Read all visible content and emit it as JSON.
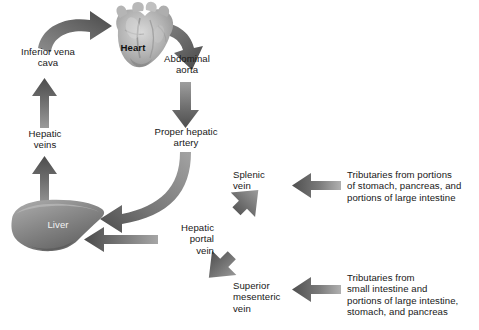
{
  "diagram": {
    "type": "flow-diagram",
    "background": "#ffffff",
    "text_color": "#181818",
    "arrow_dark": "#4a4a4a",
    "arrow_light": "#a8a8a8",
    "organ_gray": "#8d8d8d"
  },
  "labels": {
    "inferior_vena_cava": "Inferior vena\ncava",
    "heart": "Heart",
    "abdominal_aorta": "Abdominal\naorta",
    "hepatic_veins": "Hepatic\nveins",
    "proper_hepatic_artery": "Proper hepatic\nartery",
    "liver": "Liver",
    "splenic_vein": "Splenic\nvein",
    "hepatic_portal_vein": "Hepatic\nportal\nvein",
    "superior_mesenteric_vein": "Superior\nmesenteric\nvein",
    "tributaries_upper": "Tributaries from portions\nof stomach, pancreas, and\nportions of large intestine",
    "tributaries_lower": "Tributaries from\nsmall intestine and\nportions of large intestine,\nstomach, and pancreas"
  },
  "flow": {
    "nodes": [
      "Inferior vena cava",
      "Heart",
      "Abdominal aorta",
      "Hepatic veins",
      "Proper hepatic artery",
      "Liver",
      "Splenic vein",
      "Hepatic portal vein",
      "Superior mesenteric vein"
    ],
    "edges": [
      {
        "from": "Inferior vena cava",
        "to": "Heart",
        "style": "curved-arrow"
      },
      {
        "from": "Heart",
        "to": "Abdominal aorta",
        "style": "curved-arrow"
      },
      {
        "from": "Abdominal aorta",
        "to": "Proper hepatic artery",
        "style": "straight-arrow-down"
      },
      {
        "from": "Proper hepatic artery",
        "to": "Liver",
        "style": "curved-arrow"
      },
      {
        "from": "Liver",
        "to": "Hepatic veins",
        "style": "straight-arrow-up"
      },
      {
        "from": "Hepatic veins",
        "to": "Inferior vena cava",
        "style": "straight-arrow-up"
      },
      {
        "from": "Hepatic portal vein",
        "to": "Liver",
        "style": "straight-arrow-left"
      },
      {
        "from": "Splenic vein",
        "to": "Hepatic portal vein",
        "style": "diagonal-arrow-down-left"
      },
      {
        "from": "Superior mesenteric vein",
        "to": "Hepatic portal vein",
        "style": "diagonal-arrow-up-left"
      },
      {
        "from": "Tributaries (stomach, pancreas, large intestine)",
        "to": "Splenic vein",
        "style": "straight-arrow-left"
      },
      {
        "from": "Tributaries (small intestine, large intestine, stomach, pancreas)",
        "to": "Superior mesenteric vein",
        "style": "straight-arrow-left"
      }
    ]
  }
}
